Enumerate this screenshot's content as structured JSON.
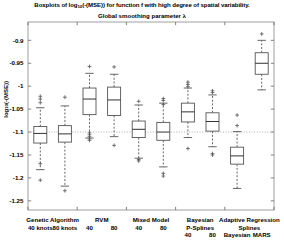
{
  "chart_data": {
    "type": "boxplot",
    "title": "Boxplots of log10(-(MSE)) for function f with high degree of spatial variability.",
    "title_parts": {
      "pre": "Boxplots of log",
      "subscript": "10",
      "post": "(-(MSE)) for function f with high degree of spatial variability."
    },
    "subtitle": "Global smoothing parameter λ",
    "xlabel": "",
    "ylabel": "log10(-(MSE))",
    "ylabel_parts": {
      "pre": "log",
      "subscript": "10",
      "post": "(-(MSE))"
    },
    "ylim": [
      -1.27,
      -0.86
    ],
    "yticks": [
      -0.9,
      -0.95,
      -1,
      -1.05,
      -1.1,
      -1.15,
      -1.2,
      -1.25
    ],
    "ytick_labels": [
      "-0.9",
      "-0.95",
      "-1",
      "-1.05",
      "-1.1",
      "-1.15",
      "-1.2",
      "-1.25"
    ],
    "grid": false,
    "reference_line": -1.1,
    "reference_line_style": "dotted",
    "groups": [
      {
        "label": "Genetic Algorithm",
        "members": [
          "40 knots",
          "80 knots"
        ]
      },
      {
        "label": "RVM",
        "members": [
          "40",
          "80"
        ]
      },
      {
        "label": "Mixed Model",
        "members": [
          "40",
          "80"
        ]
      },
      {
        "label": "Bayesian\nP-Splines",
        "members": [
          "40",
          "80"
        ]
      },
      {
        "label": "Adaptive Regression\nSplines",
        "members": [
          "Bayesian",
          "MARS"
        ]
      }
    ],
    "group_labels": [
      "Genetic Algorithm",
      "RVM",
      "Mixed Model",
      "Bayesian P-Splines",
      "Adaptive Regression Splines"
    ],
    "categories": [
      "Genetic Algorithm 40 knots",
      "Genetic Algorithm 80 knots",
      "RVM 40",
      "RVM 80",
      "Mixed Model 40",
      "Mixed Model 80",
      "Bayesian P-Splines 40",
      "Bayesian P-Splines 80",
      "Adaptive Regression Splines Bayesian",
      "Adaptive Regression Splines MARS"
    ],
    "boxes": [
      {
        "name": "Genetic Algorithm 40 knots",
        "whisker_low": -1.182,
        "q1": -1.124,
        "median": -1.103,
        "q3": -1.088,
        "whisker_high": -1.047,
        "outliers": [
          -1.205,
          -1.169,
          -1.036,
          -1.028,
          -1.022
        ]
      },
      {
        "name": "Genetic Algorithm 80 knots",
        "whisker_low": -1.218,
        "q1": -1.122,
        "median": -1.104,
        "q3": -1.086,
        "whisker_high": -1.043,
        "outliers": [
          -1.228,
          -1.024
        ]
      },
      {
        "name": "RVM 40",
        "whisker_low": -1.113,
        "q1": -1.062,
        "median": -1.028,
        "q3": -1.004,
        "whisker_high": -0.972,
        "outliers": [
          -1.118,
          -1.115,
          -1.11,
          -1.106,
          -1.102,
          -0.957
        ]
      },
      {
        "name": "RVM 80",
        "whisker_low": -1.11,
        "q1": -1.064,
        "median": -1.03,
        "q3": -1.002,
        "whisker_high": -0.974,
        "outliers": [
          -1.129,
          -0.958
        ]
      },
      {
        "name": "Mixed Model 40",
        "whisker_low": -1.157,
        "q1": -1.112,
        "median": -1.094,
        "q3": -1.076,
        "whisker_high": -1.041,
        "outliers": [
          -1.163,
          -1.16,
          -1.033
        ]
      },
      {
        "name": "Mixed Model 80",
        "whisker_low": -1.176,
        "q1": -1.118,
        "median": -1.1,
        "q3": -1.079,
        "whisker_high": -1.037,
        "outliers": [
          -1.196,
          -1.19,
          -1.04,
          -1.031,
          -1.027
        ]
      },
      {
        "name": "Bayesian P-Splines 40",
        "whisker_low": -1.112,
        "q1": -1.078,
        "median": -1.056,
        "q3": -1.037,
        "whisker_high": -1.004,
        "outliers": [
          -1.136,
          -1.001,
          -0.996,
          -0.991
        ]
      },
      {
        "name": "Bayesian P-Splines 80",
        "whisker_low": -1.132,
        "q1": -1.098,
        "median": -1.077,
        "q3": -1.058,
        "whisker_high": -1.019,
        "outliers": [
          -1.15,
          -1.147,
          -1.014,
          -1.01
        ]
      },
      {
        "name": "Adaptive Regression Splines Bayesian",
        "whisker_low": -1.223,
        "q1": -1.17,
        "median": -1.152,
        "q3": -1.133,
        "whisker_high": -1.099,
        "outliers": [
          -1.086,
          -1.063
        ]
      },
      {
        "name": "Adaptive Regression Splines MARS",
        "whisker_low": -1.008,
        "q1": -0.974,
        "median": -0.95,
        "q3": -0.927,
        "whisker_high": -0.9,
        "outliers": [
          -0.886
        ]
      }
    ]
  }
}
